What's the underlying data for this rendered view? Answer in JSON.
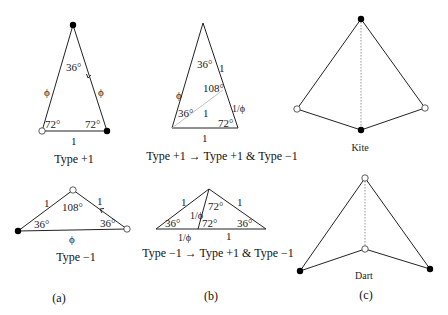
{
  "panels": {
    "a": {
      "label": "(a)",
      "type_plus": {
        "caption": "Type +1",
        "apex_angle": "36°",
        "left_angle": "72°",
        "right_angle": "72°",
        "left_side": "ϕ",
        "right_side": "ϕ",
        "base": "1"
      },
      "type_minus": {
        "caption": "Type −1",
        "apex_angle": "108°",
        "left_angle": "36°",
        "right_angle": "36°",
        "left_side": "1",
        "right_side": "1",
        "base": "ϕ"
      }
    },
    "b": {
      "label": "(b)",
      "top": {
        "caption": "Type +1 → Type +1 & Type −1",
        "apex_angle": "36°",
        "left_angle": "36°",
        "inner_angle": "108°",
        "right_angle": "72°",
        "left_side": "ϕ",
        "right_upper": "1",
        "right_lower": "1/ϕ",
        "diagonal": "1",
        "base": "1"
      },
      "bottom": {
        "caption": "Type −1 → Type +1 & Type −1",
        "apex_left_angle": "72°",
        "mid_angle": "72°",
        "left_angle": "36°",
        "right_angle": "36°",
        "left_side": "1",
        "right_side": "1",
        "split_side": "1/ϕ",
        "base_left": "1/ϕ",
        "base_right": "1"
      }
    },
    "c": {
      "label": "(c)",
      "kite_caption": "Kite",
      "dart_caption": "Dart"
    }
  }
}
